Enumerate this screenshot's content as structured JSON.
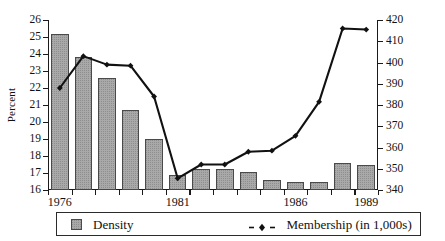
{
  "chart_data": {
    "type": "bar",
    "title": "",
    "subtitle": "",
    "xlabel": "",
    "ylabel": "Percent",
    "y2label": "",
    "grid": false,
    "legend_position": "bottom",
    "x": [
      1976,
      1977,
      1978,
      1979,
      1980,
      1981,
      1982,
      1983,
      1984,
      1985,
      1986,
      1987,
      1988,
      1989
    ],
    "categories": [
      "1976",
      "1977",
      "1978",
      "1979",
      "1980",
      "1981",
      "1982",
      "1983",
      "1984",
      "1985",
      "1986",
      "1987",
      "1988",
      "1989"
    ],
    "xtick_labels": [
      "1976",
      "1981",
      "1986",
      "1989"
    ],
    "xtick_values": [
      1976,
      1981,
      1986,
      1989
    ],
    "ylim": [
      16,
      26
    ],
    "yticks": [
      16,
      17,
      18,
      19,
      20,
      21,
      22,
      23,
      24,
      25,
      26
    ],
    "ytick_labels": [
      "16",
      "17",
      "18",
      "19",
      "20",
      "21",
      "22",
      "23",
      "24",
      "25",
      "26"
    ],
    "y2lim": [
      340,
      420
    ],
    "y2ticks": [
      340,
      350,
      360,
      370,
      380,
      390,
      400,
      410,
      420
    ],
    "y2tick_labels": [
      "340",
      "350",
      "360",
      "370",
      "380",
      "390",
      "400",
      "410",
      "420"
    ],
    "series": [
      {
        "name": "Density",
        "type": "bar",
        "axis": "left",
        "unit": "percent",
        "color": "#a9a9a9",
        "edge_color": "#4a4a4a",
        "values": [
          25.15,
          23.85,
          22.6,
          20.7,
          19.0,
          16.9,
          17.25,
          17.25,
          17.05,
          16.6,
          16.45,
          16.45,
          17.6,
          17.5
        ]
      },
      {
        "name": "Membership (in 1,000s)",
        "type": "line",
        "axis": "right",
        "unit": "thousands",
        "color": "#111111",
        "marker": "diamond",
        "values": [
          388,
          403,
          399,
          398.5,
          384,
          345.5,
          352,
          352,
          358,
          358.5,
          365.5,
          381.5,
          416,
          415.5
        ]
      }
    ]
  },
  "axes": {
    "left_axis_label": "Percent",
    "left_ticks": [
      "26",
      "25",
      "24",
      "23",
      "22",
      "21",
      "20",
      "19",
      "18",
      "17",
      "16"
    ],
    "right_ticks": [
      "420",
      "410",
      "400",
      "390",
      "380",
      "370",
      "360",
      "350",
      "340"
    ],
    "x_ticks": [
      "1976",
      "1981",
      "1986",
      "1989"
    ]
  },
  "legend": {
    "density": {
      "label": "Density",
      "swatch_name": "density-bar-swatch"
    },
    "membership": {
      "label": "Membership (in 1,000s)",
      "key_name": "membership-line-swatch"
    }
  },
  "colors": {
    "bar_fill": "#a9a9a9",
    "bar_edge": "#4a4a4a",
    "line": "#111111",
    "axis": "#1a1a1a",
    "background": "#ffffff"
  }
}
